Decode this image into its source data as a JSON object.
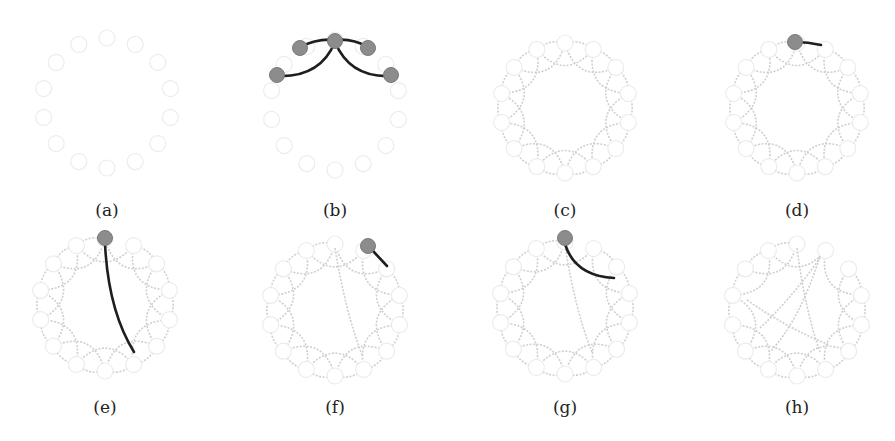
{
  "figure": {
    "node_count": 14,
    "colors": {
      "ghost_node_stroke": "#ececec",
      "ring_edge": "#cfcfcf",
      "active_edge": "#1e1e1e",
      "active_node": "#8c8c8c"
    },
    "panels": [
      {
        "id": "a",
        "label": "(a)",
        "cx": 107,
        "cy": 103,
        "r": 65,
        "state": "nodes only"
      },
      {
        "id": "b",
        "label": "(b)",
        "cx": 335,
        "cy": 105,
        "r": 65,
        "state": "top node connecting to 4 nearest neighbors"
      },
      {
        "id": "c",
        "label": "(c)",
        "cx": 565,
        "cy": 108,
        "r": 65,
        "state": "complete regular ring lattice (k=4)"
      },
      {
        "id": "d",
        "label": "(d)",
        "cx": 797,
        "cy": 108,
        "r": 65,
        "state": "top node edge selected for rewiring"
      },
      {
        "id": "e",
        "label": "(e)",
        "cx": 105,
        "cy": 305,
        "r": 66,
        "state": "edge rewired to far node"
      },
      {
        "id": "f",
        "label": "(f)",
        "cx": 335,
        "cy": 310,
        "r": 66,
        "state": "next node edge selected"
      },
      {
        "id": "g",
        "label": "(g)",
        "cx": 565,
        "cy": 308,
        "r": 66,
        "state": "second-neighbor edge selected"
      },
      {
        "id": "h",
        "label": "(h)",
        "cx": 797,
        "cy": 310,
        "r": 66,
        "state": "final rewired small-world graph"
      }
    ]
  }
}
